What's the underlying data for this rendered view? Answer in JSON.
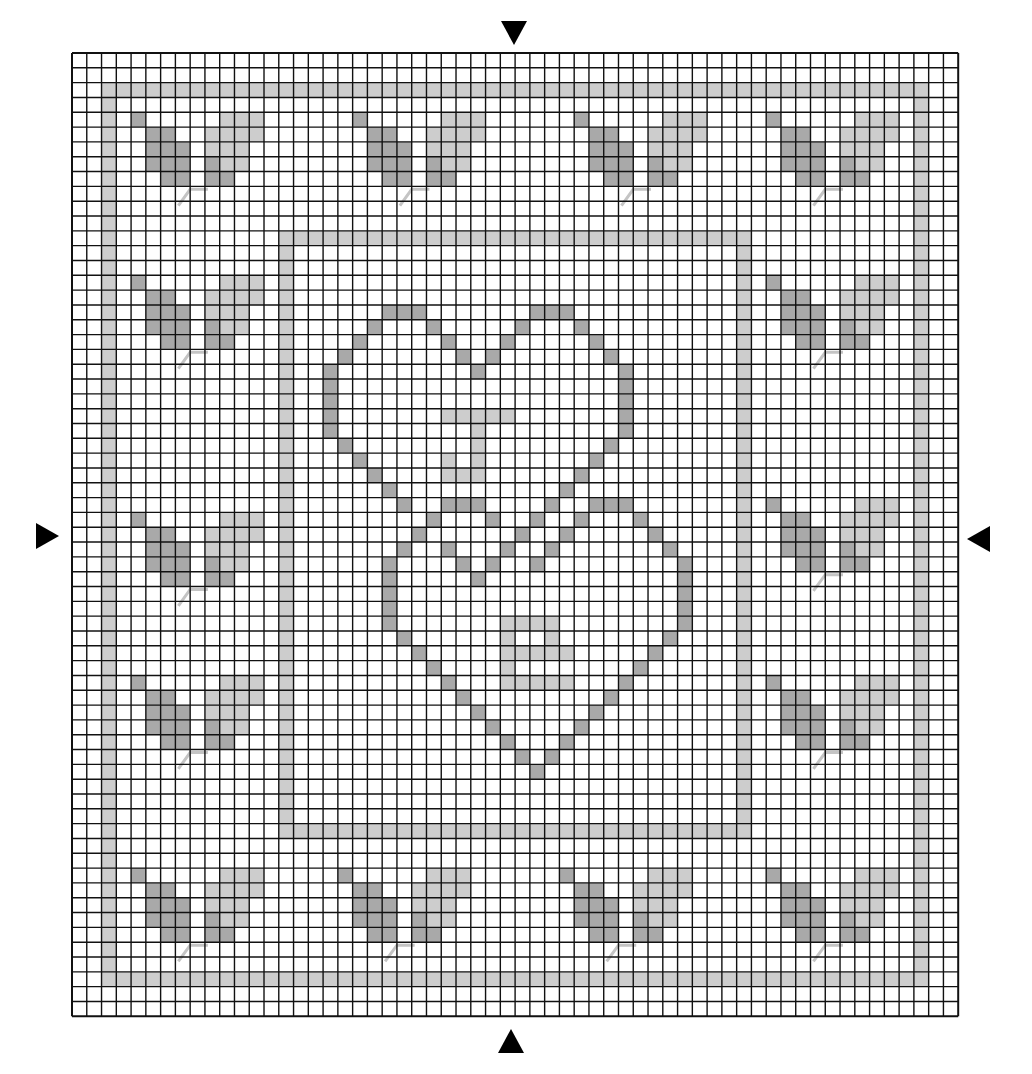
{
  "colors": {
    "background": "#ffffff",
    "grid_line": "#111111",
    "dark_stitch": "#a9a9a9",
    "light_stitch": "#cdcdcd",
    "backstitch": "#c4c4c4",
    "marker": "#000000"
  },
  "grid": {
    "left": 72,
    "top": 53,
    "cols": 60,
    "rows": 65,
    "cell_w": 14.77,
    "cell_h": 14.82
  },
  "center_markers": [
    {
      "name": "top-center-marker",
      "direction": "down"
    },
    {
      "name": "bottom-center-marker",
      "direction": "up"
    },
    {
      "name": "left-center-marker",
      "direction": "right"
    },
    {
      "name": "right-center-marker",
      "direction": "left"
    }
  ],
  "frames": [
    {
      "name": "outer-frame",
      "shade": "light",
      "col0": 2,
      "row0": 2,
      "col1": 57,
      "row1": 62
    },
    {
      "name": "inner-frame",
      "shade": "light",
      "col0": 14,
      "row0": 12,
      "col1": 45,
      "row1": 52
    }
  ],
  "leaf_motif": {
    "dark": [
      [
        0,
        0
      ],
      [
        1,
        1
      ],
      [
        2,
        1
      ],
      [
        1,
        2
      ],
      [
        2,
        2
      ],
      [
        3,
        2
      ],
      [
        1,
        3
      ],
      [
        2,
        3
      ],
      [
        3,
        3
      ],
      [
        2,
        4
      ],
      [
        3,
        4
      ],
      [
        5,
        3
      ],
      [
        5,
        4
      ],
      [
        6,
        4
      ]
    ],
    "light": [
      [
        6,
        0
      ],
      [
        7,
        0
      ],
      [
        8,
        0
      ],
      [
        5,
        1
      ],
      [
        6,
        1
      ],
      [
        7,
        1
      ],
      [
        8,
        1
      ],
      [
        5,
        2
      ],
      [
        6,
        2
      ],
      [
        7,
        2
      ],
      [
        6,
        3
      ],
      [
        7,
        3
      ]
    ],
    "stem": [
      [
        5.2,
        5.2
      ],
      [
        4.0,
        5.2
      ],
      [
        3.2,
        6.3
      ]
    ]
  },
  "leaf_positions": [
    [
      4,
      4
    ],
    [
      19,
      4
    ],
    [
      34,
      4
    ],
    [
      47,
      4
    ],
    [
      4,
      15
    ],
    [
      4,
      31
    ],
    [
      4,
      42
    ],
    [
      47,
      15
    ],
    [
      47,
      30
    ],
    [
      47,
      42
    ],
    [
      4,
      55
    ],
    [
      18,
      55
    ],
    [
      33,
      55
    ],
    [
      47,
      55
    ]
  ],
  "hearts": {
    "dark": [
      [
        21,
        17
      ],
      [
        22,
        17
      ],
      [
        23,
        17
      ],
      [
        31,
        17
      ],
      [
        32,
        17
      ],
      [
        33,
        17
      ],
      [
        20,
        18
      ],
      [
        24,
        18
      ],
      [
        30,
        18
      ],
      [
        34,
        18
      ],
      [
        19,
        19
      ],
      [
        25,
        19
      ],
      [
        29,
        19
      ],
      [
        35,
        19
      ],
      [
        18,
        20
      ],
      [
        26,
        20
      ],
      [
        28,
        20
      ],
      [
        36,
        20
      ],
      [
        17,
        21
      ],
      [
        27,
        21
      ],
      [
        37,
        21
      ],
      [
        17,
        22
      ],
      [
        37,
        22
      ],
      [
        17,
        23
      ],
      [
        37,
        23
      ],
      [
        17,
        24
      ],
      [
        37,
        24
      ],
      [
        17,
        25
      ],
      [
        37,
        25
      ],
      [
        18,
        26
      ],
      [
        36,
        26
      ],
      [
        19,
        27
      ],
      [
        35,
        27
      ],
      [
        20,
        28
      ],
      [
        34,
        28
      ],
      [
        21,
        29
      ],
      [
        33,
        29
      ],
      [
        22,
        30
      ],
      [
        25,
        30
      ],
      [
        26,
        30
      ],
      [
        27,
        30
      ],
      [
        32,
        30
      ],
      [
        35,
        30
      ],
      [
        36,
        30
      ],
      [
        37,
        30
      ],
      [
        24,
        31
      ],
      [
        28,
        31
      ],
      [
        31,
        31
      ],
      [
        34,
        31
      ],
      [
        38,
        31
      ],
      [
        23,
        32
      ],
      [
        30,
        32
      ],
      [
        33,
        32
      ],
      [
        39,
        32
      ],
      [
        22,
        33
      ],
      [
        25,
        33
      ],
      [
        29,
        33
      ],
      [
        32,
        33
      ],
      [
        40,
        33
      ],
      [
        21,
        34
      ],
      [
        26,
        34
      ],
      [
        28,
        34
      ],
      [
        31,
        34
      ],
      [
        41,
        34
      ],
      [
        21,
        35
      ],
      [
        27,
        35
      ],
      [
        41,
        35
      ],
      [
        21,
        36
      ],
      [
        41,
        36
      ],
      [
        21,
        37
      ],
      [
        41,
        37
      ],
      [
        21,
        38
      ],
      [
        41,
        38
      ],
      [
        22,
        39
      ],
      [
        40,
        39
      ],
      [
        23,
        40
      ],
      [
        39,
        40
      ],
      [
        24,
        41
      ],
      [
        38,
        41
      ],
      [
        25,
        42
      ],
      [
        37,
        42
      ],
      [
        26,
        43
      ],
      [
        36,
        43
      ],
      [
        27,
        44
      ],
      [
        35,
        44
      ],
      [
        28,
        45
      ],
      [
        34,
        45
      ],
      [
        29,
        46
      ],
      [
        33,
        46
      ],
      [
        30,
        47
      ],
      [
        32,
        47
      ],
      [
        31,
        48
      ]
    ],
    "light": [
      [
        25,
        24
      ],
      [
        26,
        24
      ],
      [
        27,
        24
      ],
      [
        28,
        24
      ],
      [
        29,
        24
      ],
      [
        27,
        25
      ],
      [
        27,
        26
      ],
      [
        25,
        27
      ],
      [
        27,
        27
      ],
      [
        25,
        28
      ],
      [
        26,
        28
      ],
      [
        27,
        28
      ],
      [
        29,
        38
      ],
      [
        30,
        38
      ],
      [
        31,
        38
      ],
      [
        32,
        38
      ],
      [
        29,
        39
      ],
      [
        32,
        39
      ],
      [
        29,
        40
      ],
      [
        30,
        40
      ],
      [
        31,
        40
      ],
      [
        32,
        40
      ],
      [
        33,
        40
      ],
      [
        29,
        41
      ],
      [
        29,
        42
      ],
      [
        30,
        42
      ],
      [
        31,
        42
      ],
      [
        32,
        42
      ],
      [
        33,
        42
      ]
    ]
  }
}
